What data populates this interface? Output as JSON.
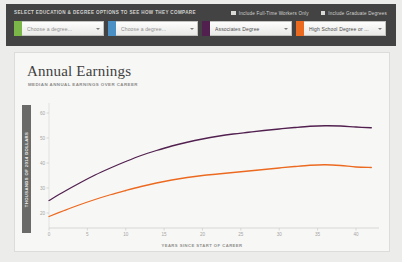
{
  "controls": {
    "title": "SELECT EDUCATION & DEGREE OPTIONS TO SEE HOW THEY COMPARE",
    "checkboxes": [
      {
        "label": "Include Full-Time Workers Only",
        "checked": true,
        "icon": "checkbox-checked-icon"
      },
      {
        "label": "Include Graduate Degrees",
        "checked": true,
        "icon": "checkbox-filled-icon"
      }
    ],
    "selectors": [
      {
        "value": "Choose a degree...",
        "placeholder": "Choose a degree...",
        "is_placeholder": true,
        "color": "#7ab648",
        "caret": "chevron-down-icon"
      },
      {
        "value": "Choose a degree...",
        "placeholder": "Choose a degree...",
        "is_placeholder": true,
        "color": "#4a90c4",
        "caret": "chevron-down-icon"
      },
      {
        "value": "Associates Degree",
        "placeholder": "Choose a degree...",
        "is_placeholder": false,
        "color": "#52204f",
        "caret": "chevron-down-icon"
      },
      {
        "value": "High School Degree or ...",
        "placeholder": "Choose a degree...",
        "is_placeholder": false,
        "color": "#ec6a20",
        "caret": "chevron-down-icon"
      }
    ]
  },
  "chart_data": {
    "type": "line",
    "title": "Annual Earnings",
    "subtitle": "MEDIAN ANNUAL EARNINGS OVER CAREER",
    "xlabel": "YEARS SINCE START OF CAREER",
    "ylabel": "THOUSANDS OF 2014 DOLLARS",
    "xlim": [
      0,
      43
    ],
    "ylim": [
      14,
      64
    ],
    "xticks": [
      0,
      5,
      10,
      15,
      20,
      25,
      30,
      35,
      40
    ],
    "yticks": [
      20,
      30,
      40,
      50,
      60
    ],
    "grid": false,
    "legend_position": "none",
    "x": [
      0,
      2,
      4,
      6,
      8,
      10,
      12,
      14,
      16,
      18,
      20,
      22,
      24,
      26,
      28,
      30,
      32,
      34,
      36,
      38,
      40,
      42
    ],
    "series": [
      {
        "name": "Associates Degree",
        "color": "#52204f",
        "values": [
          25.0,
          28.6,
          32.0,
          35.2,
          38.0,
          40.6,
          43.0,
          45.0,
          46.8,
          48.3,
          49.6,
          50.7,
          51.6,
          52.3,
          53.0,
          53.6,
          54.2,
          54.7,
          54.9,
          54.8,
          54.4,
          54.1
        ]
      },
      {
        "name": "High School Degree or ...",
        "color": "#ec6a20",
        "values": [
          18.6,
          21.0,
          23.3,
          25.4,
          27.3,
          29.0,
          30.6,
          32.0,
          33.2,
          34.2,
          35.0,
          35.6,
          36.2,
          36.8,
          37.4,
          38.0,
          38.6,
          39.1,
          39.3,
          39.0,
          38.4,
          38.2
        ]
      }
    ]
  }
}
